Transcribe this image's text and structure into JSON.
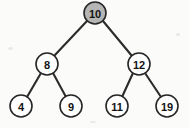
{
  "figure": {
    "name": "binary-search-tree",
    "background_color": "#fbfbfa",
    "width": 189,
    "height": 128
  },
  "style": {
    "node_stroke_color": "#262626",
    "node_fill_default": "#ffffff",
    "node_fill_highlight": "#b5b5b5",
    "edge_color": "#2b2b2b",
    "label_color": "#141414",
    "node_radius": 11
  },
  "chart_data": {
    "type": "diagram",
    "diagram_kind": "binary-search-tree",
    "title": "",
    "nodes": [
      {
        "id": "n10",
        "label": "10",
        "x": 95,
        "y": 13,
        "r": 11,
        "fill": "#b5b5b5",
        "highlighted": true,
        "level": 0
      },
      {
        "id": "n8",
        "label": "8",
        "x": 47,
        "y": 64,
        "r": 11,
        "fill": "#ffffff",
        "highlighted": false,
        "level": 1
      },
      {
        "id": "n12",
        "label": "12",
        "x": 139,
        "y": 64,
        "r": 11,
        "fill": "#ffffff",
        "highlighted": false,
        "level": 1
      },
      {
        "id": "n4",
        "label": "4",
        "x": 21,
        "y": 106,
        "r": 11,
        "fill": "#ffffff",
        "highlighted": false,
        "level": 2
      },
      {
        "id": "n9",
        "label": "9",
        "x": 71,
        "y": 106,
        "r": 11,
        "fill": "#ffffff",
        "highlighted": false,
        "level": 2
      },
      {
        "id": "n11",
        "label": "11",
        "x": 117,
        "y": 106,
        "r": 11,
        "fill": "#ffffff",
        "highlighted": false,
        "level": 2
      },
      {
        "id": "n19",
        "label": "19",
        "x": 167,
        "y": 106,
        "r": 11,
        "fill": "#ffffff",
        "highlighted": false,
        "level": 2
      }
    ],
    "edges": [
      {
        "id": "e-10-8",
        "from": "n10",
        "to": "n8",
        "x1": 87,
        "y1": 21,
        "x2": 54,
        "y2": 56
      },
      {
        "id": "e-10-12",
        "from": "n10",
        "to": "n12",
        "x1": 103,
        "y1": 21,
        "x2": 132,
        "y2": 56
      },
      {
        "id": "e-8-4",
        "from": "n8",
        "to": "n4",
        "x1": 41,
        "y1": 73,
        "x2": 27,
        "y2": 97
      },
      {
        "id": "e-8-9",
        "from": "n8",
        "to": "n9",
        "x1": 53,
        "y1": 73,
        "x2": 66,
        "y2": 97
      },
      {
        "id": "e-12-11",
        "from": "n12",
        "to": "n11",
        "x1": 133,
        "y1": 73,
        "x2": 122,
        "y2": 97
      },
      {
        "id": "e-12-19",
        "from": "n12",
        "to": "n19",
        "x1": 145,
        "y1": 73,
        "x2": 161,
        "y2": 97
      }
    ]
  }
}
